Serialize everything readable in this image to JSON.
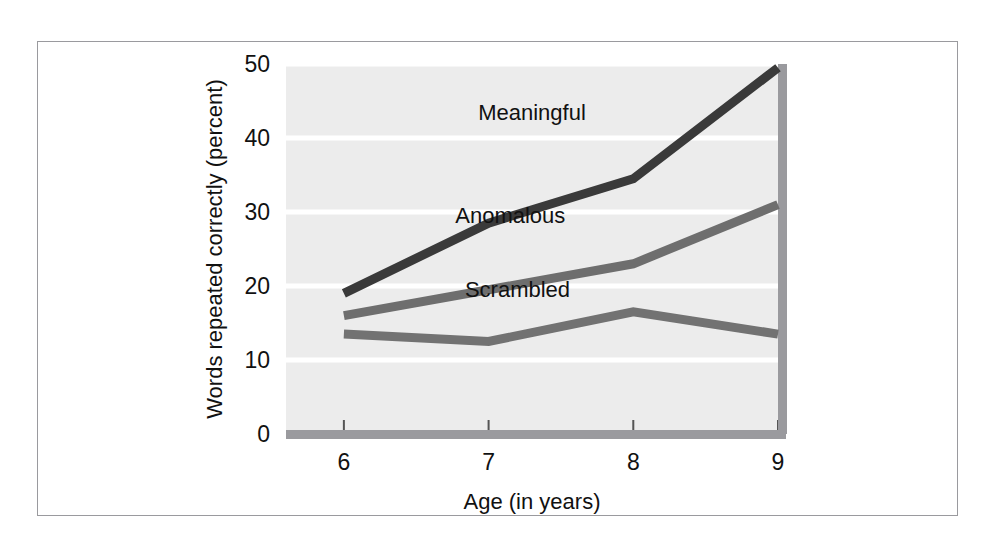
{
  "figure": {
    "frame_color": "#9a9a9e",
    "plot_background": "#ececec",
    "gridline_color": "#ffffff",
    "axis_bar_color": "#9a9a9e"
  },
  "chart_data": {
    "type": "line",
    "title": "",
    "subtitle": "",
    "xlabel": "Age (in years)",
    "ylabel": "Words repeated correctly (percent)",
    "x": [
      6,
      7,
      8,
      9
    ],
    "categories": [
      "6",
      "7",
      "8",
      "9"
    ],
    "xtick_labels": [
      "6",
      "7",
      "8",
      "9"
    ],
    "ytick_labels": [
      "0",
      "10",
      "20",
      "30",
      "40",
      "50"
    ],
    "ytick_values": [
      0,
      10,
      20,
      30,
      40,
      50
    ],
    "xlim": [
      5.6,
      9.0
    ],
    "ylim": [
      0,
      50
    ],
    "grid": true,
    "grid_axis": "y",
    "legend": "inline-labels",
    "legend_position": "inside-plot",
    "series": [
      {
        "name": "Meaningful",
        "label": "Meaningful",
        "color": "#3a3a3a",
        "values": [
          19,
          28.5,
          34.5,
          49.5
        ],
        "label_x": 7.3,
        "label_y": 42.5
      },
      {
        "name": "Anomalous",
        "label": "Anomalous",
        "color": "#6e6e6e",
        "values": [
          16,
          19.5,
          23,
          31
        ],
        "label_x": 7.15,
        "label_y": 28.5
      },
      {
        "name": "Scrambled",
        "label": "Scrambled",
        "color": "#727272",
        "values": [
          13.5,
          12.5,
          16.5,
          13.5
        ],
        "label_x": 7.2,
        "label_y": 18.5
      }
    ]
  }
}
